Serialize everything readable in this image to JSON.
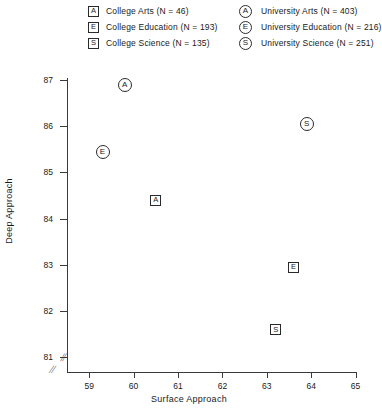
{
  "legend": {
    "left": [
      {
        "marker": "square",
        "glyph": "A",
        "name": "College Arts",
        "n": 46,
        "label": "College Arts (N = 46)"
      },
      {
        "marker": "square",
        "glyph": "E",
        "name": "College Education",
        "n": 193,
        "label": "College Education (N = 193)"
      },
      {
        "marker": "square",
        "glyph": "S",
        "name": "College Science",
        "n": 135,
        "label": "College Science (N = 135)"
      }
    ],
    "right": [
      {
        "marker": "circle",
        "glyph": "A",
        "name": "University Arts",
        "n": 403,
        "label": "University Arts (N = 403)"
      },
      {
        "marker": "circle",
        "glyph": "E",
        "name": "University Education",
        "n": 216,
        "label": "University Education (N = 216)"
      },
      {
        "marker": "circle",
        "glyph": "S",
        "name": "University Science",
        "n": 251,
        "label": "University Science (N = 251)"
      }
    ]
  },
  "axes": {
    "x_label": "Surface Approach",
    "y_label": "Deep Approach",
    "x_ticks": [
      "59",
      "60",
      "61",
      "62",
      "63",
      "64",
      "65"
    ],
    "y_ticks": [
      "87",
      "86",
      "85",
      "84",
      "83",
      "82",
      "81"
    ],
    "break_symbol": "//"
  },
  "chart_data": {
    "type": "scatter",
    "title": "",
    "xlabel": "Surface Approach",
    "ylabel": "Deep Approach",
    "xlim": [
      58.5,
      65
    ],
    "ylim": [
      80.7,
      87
    ],
    "xticks": [
      59,
      60,
      61,
      62,
      63,
      64,
      65
    ],
    "yticks": [
      81,
      82,
      83,
      84,
      85,
      86,
      87
    ],
    "grid": false,
    "axis_break": {
      "x": true,
      "y": true
    },
    "legend_position": "top",
    "points": [
      {
        "label": "College Arts",
        "glyph": "A",
        "marker": "square",
        "n": 46,
        "x": 60.5,
        "y": 84.4
      },
      {
        "label": "College Education",
        "glyph": "E",
        "marker": "square",
        "n": 193,
        "x": 63.6,
        "y": 82.95
      },
      {
        "label": "College Science",
        "glyph": "S",
        "marker": "square",
        "n": 135,
        "x": 63.2,
        "y": 81.6
      },
      {
        "label": "University Arts",
        "glyph": "A",
        "marker": "circle",
        "n": 403,
        "x": 59.8,
        "y": 86.9
      },
      {
        "label": "University Education",
        "glyph": "E",
        "marker": "circle",
        "n": 216,
        "x": 59.3,
        "y": 85.45
      },
      {
        "label": "University Science",
        "glyph": "S",
        "marker": "circle",
        "n": 251,
        "x": 63.9,
        "y": 86.05
      }
    ]
  },
  "colors": {
    "ink": "#2a2a2a",
    "axis": "#3a3a3a",
    "background": "#ffffff"
  }
}
